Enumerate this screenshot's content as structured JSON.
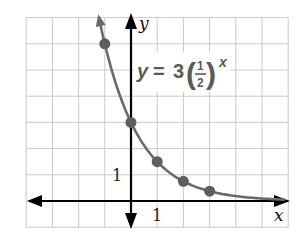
{
  "chart_data": {
    "type": "line",
    "title": "",
    "equation": "y = 3(1/2)^x",
    "equation_parts": {
      "lhs": "y",
      "equals": "=",
      "coef": "3",
      "num": "1",
      "den": "2",
      "exp": "x"
    },
    "xlabel": "x",
    "ylabel": "y",
    "xlim": [
      -4,
      6
    ],
    "ylim": [
      -1,
      7
    ],
    "grid": true,
    "grid_step": 1,
    "tick_labels": {
      "x": [
        "1"
      ],
      "y": [
        "1"
      ]
    },
    "series": [
      {
        "name": "y = 3(1/2)^x",
        "function": "3*(0.5)^x",
        "points": [
          {
            "x": -1,
            "y": 6
          },
          {
            "x": 0,
            "y": 3
          },
          {
            "x": 1,
            "y": 1.5
          },
          {
            "x": 2,
            "y": 0.75
          },
          {
            "x": 3,
            "y": 0.375
          }
        ]
      }
    ],
    "colors": {
      "curve": "#6a6a6a",
      "points": "#5e5e5e",
      "grid": "#c9c9c9",
      "axes": "#000000"
    }
  }
}
